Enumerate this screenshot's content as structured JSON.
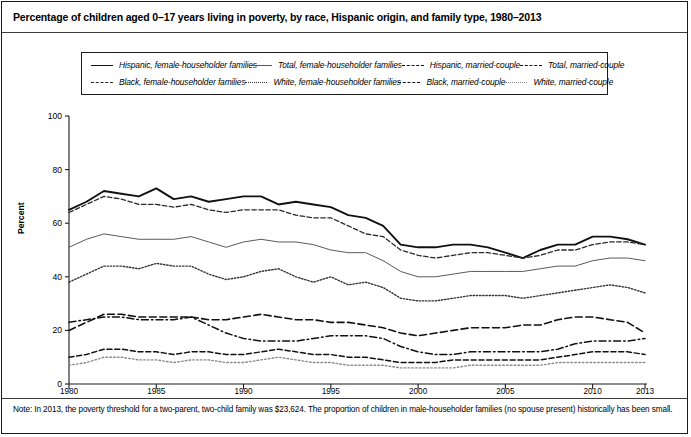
{
  "title": "Percentage of children aged 0–17 years living in poverty, by race, Hispanic origin, and family type, 1980–2013",
  "note": "Note: In 2013, the poverty threshold for a two-parent, two-child family was $23,624. The proportion of children in male-householder families (no spouse present) historically has been small.",
  "legend": {
    "items": [
      {
        "label": "Hispanic, female-householder families",
        "style": "solid-thick",
        "color": "#111111"
      },
      {
        "label": "Total, female-householder families",
        "style": "solid-thin",
        "color": "#5a5a5a"
      },
      {
        "label": "Hispanic, married-couple",
        "style": "dash-long",
        "color": "#111111"
      },
      {
        "label": "Total, married-couple",
        "style": "dash-med",
        "color": "#111111"
      },
      {
        "label": "Black, female-householder families",
        "style": "dash-fine",
        "color": "#2a2a2a"
      },
      {
        "label": "White, female-householder families",
        "style": "dot",
        "color": "#333333"
      },
      {
        "label": "Black, married-couple",
        "style": "dashdot",
        "color": "#111111"
      },
      {
        "label": "White, married-couple",
        "style": "dot-light",
        "color": "#8a8a8a"
      }
    ]
  },
  "chart_data": {
    "type": "line",
    "title": "Percentage of children aged 0–17 years living in poverty, by race, Hispanic origin, and family type, 1980–2013",
    "xlabel": "",
    "ylabel": "Percent",
    "ylim": [
      0,
      100
    ],
    "xlim": [
      1980,
      2013
    ],
    "yticks": [
      0,
      20,
      40,
      60,
      80,
      100
    ],
    "xticks": [
      1980,
      1985,
      1990,
      1995,
      2000,
      2005,
      2010,
      2013
    ],
    "grid": false,
    "legend_position": "top",
    "x": [
      1980,
      1981,
      1982,
      1983,
      1984,
      1985,
      1986,
      1987,
      1988,
      1989,
      1990,
      1991,
      1992,
      1993,
      1994,
      1995,
      1996,
      1997,
      1998,
      1999,
      2000,
      2001,
      2002,
      2003,
      2004,
      2005,
      2006,
      2007,
      2008,
      2009,
      2010,
      2011,
      2012,
      2013
    ],
    "series": [
      {
        "name": "Hispanic, female-householder families",
        "style": "solid-thick",
        "color": "#111111",
        "values": [
          65,
          68,
          72,
          71,
          70,
          73,
          69,
          70,
          68,
          69,
          70,
          70,
          67,
          68,
          67,
          66,
          63,
          62,
          59,
          52,
          51,
          51,
          52,
          52,
          51,
          49,
          47,
          50,
          52,
          52,
          55,
          55,
          54,
          52
        ]
      },
      {
        "name": "Black, female-householder families",
        "style": "dash-fine",
        "color": "#2a2a2a",
        "values": [
          64,
          67,
          70,
          69,
          67,
          67,
          66,
          67,
          65,
          64,
          65,
          65,
          65,
          63,
          62,
          62,
          59,
          56,
          55,
          50,
          48,
          47,
          48,
          49,
          49,
          48,
          47,
          48,
          50,
          50,
          52,
          53,
          53,
          52
        ]
      },
      {
        "name": "Total, female-householder families",
        "style": "solid-thin",
        "color": "#5a5a5a",
        "values": [
          51,
          54,
          56,
          55,
          54,
          54,
          54,
          55,
          53,
          51,
          53,
          54,
          53,
          53,
          52,
          50,
          49,
          49,
          46,
          42,
          40,
          40,
          41,
          42,
          42,
          42,
          42,
          43,
          44,
          44,
          46,
          47,
          47,
          46
        ]
      },
      {
        "name": "White, female-householder families",
        "style": "dot",
        "color": "#333333",
        "values": [
          38,
          41,
          44,
          44,
          43,
          45,
          44,
          44,
          41,
          39,
          40,
          42,
          43,
          40,
          38,
          40,
          37,
          38,
          36,
          32,
          31,
          31,
          32,
          33,
          33,
          33,
          32,
          33,
          34,
          35,
          36,
          37,
          36,
          34
        ]
      },
      {
        "name": "Hispanic, married-couple",
        "style": "dash-long",
        "color": "#111111",
        "values": [
          20,
          23,
          26,
          26,
          25,
          25,
          25,
          25,
          24,
          24,
          25,
          26,
          25,
          24,
          24,
          23,
          23,
          22,
          21,
          19,
          18,
          19,
          20,
          21,
          21,
          21,
          22,
          22,
          24,
          25,
          25,
          24,
          23,
          19
        ]
      },
      {
        "name": "Black, married-couple",
        "style": "dashdot",
        "color": "#111111",
        "values": [
          23,
          24,
          25,
          25,
          24,
          24,
          24,
          25,
          22,
          19,
          17,
          16,
          16,
          16,
          17,
          18,
          18,
          18,
          17,
          14,
          12,
          11,
          11,
          12,
          12,
          12,
          12,
          12,
          13,
          15,
          16,
          16,
          16,
          17
        ]
      },
      {
        "name": "Total, married-couple",
        "style": "dash-med",
        "color": "#111111",
        "values": [
          10,
          11,
          13,
          13,
          12,
          12,
          11,
          12,
          12,
          11,
          11,
          12,
          13,
          12,
          11,
          11,
          10,
          10,
          9,
          8,
          8,
          8,
          9,
          9,
          9,
          9,
          9,
          9,
          10,
          11,
          12,
          12,
          12,
          11
        ]
      },
      {
        "name": "White, married-couple",
        "style": "dot-light",
        "color": "#8a8a8a",
        "values": [
          7,
          8,
          10,
          10,
          9,
          9,
          8,
          9,
          9,
          8,
          8,
          9,
          10,
          9,
          8,
          8,
          7,
          7,
          7,
          6,
          6,
          6,
          6,
          7,
          7,
          7,
          7,
          7,
          8,
          8,
          8,
          8,
          8,
          8
        ]
      }
    ]
  }
}
